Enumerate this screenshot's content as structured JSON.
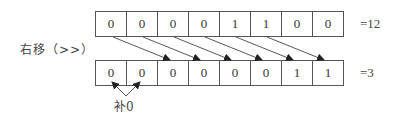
{
  "diagram": {
    "operation_label": "右移（>>）",
    "top_row": {
      "bits": [
        "0",
        "0",
        "0",
        "0",
        "1",
        "1",
        "0",
        "0"
      ],
      "result": "=12"
    },
    "bottom_row": {
      "bits": [
        "0",
        "0",
        "0",
        "0",
        "0",
        "0",
        "1",
        "1"
      ],
      "result": "=3"
    },
    "padding_label": "补0",
    "shift_amount": 2,
    "colors": {
      "line": "#555555",
      "text": "#333333",
      "arrow": "#222222"
    }
  }
}
